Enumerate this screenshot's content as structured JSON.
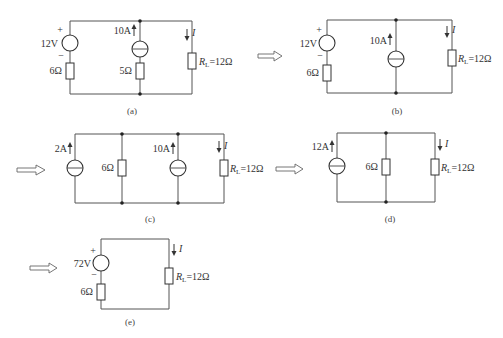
{
  "figure": {
    "faint_header_text": "",
    "faint_footer_text": ""
  },
  "circuits": {
    "a": {
      "caption": "(a)",
      "voltage_source": {
        "label": "12V",
        "plus": "+",
        "minus": "−"
      },
      "series_resistor": "6Ω",
      "current_source": "10A",
      "current_source_resistor": "5Ω",
      "current_label": "I",
      "load": {
        "name": "R",
        "sub": "L",
        "value": "=12Ω"
      }
    },
    "b": {
      "caption": "(b)",
      "voltage_source": {
        "label": "12V",
        "plus": "+",
        "minus": "−"
      },
      "series_resistor": "6Ω",
      "current_source": "10A",
      "current_label": "I",
      "load": {
        "name": "R",
        "sub": "L",
        "value": "=12Ω"
      }
    },
    "c": {
      "caption": "(c)",
      "current_source_1": "2A",
      "shunt_resistor": "6Ω",
      "current_source_2": "10A",
      "current_label": "I",
      "load": {
        "name": "R",
        "sub": "L",
        "value": "=12Ω"
      }
    },
    "d": {
      "caption": "(d)",
      "current_source": "12A",
      "shunt_resistor": "6Ω",
      "current_label": "I",
      "load": {
        "name": "R",
        "sub": "L",
        "value": "=12Ω"
      }
    },
    "e": {
      "caption": "(e)",
      "voltage_source": {
        "label": "72V",
        "plus": "+",
        "minus": "−"
      },
      "series_resistor": "6Ω",
      "current_label": "I",
      "load": {
        "name": "R",
        "sub": "L",
        "value": "=12Ω"
      }
    }
  },
  "transition_arrows": [
    "a-to-b",
    "b-to-c",
    "c-to-d",
    "d-to-e"
  ]
}
